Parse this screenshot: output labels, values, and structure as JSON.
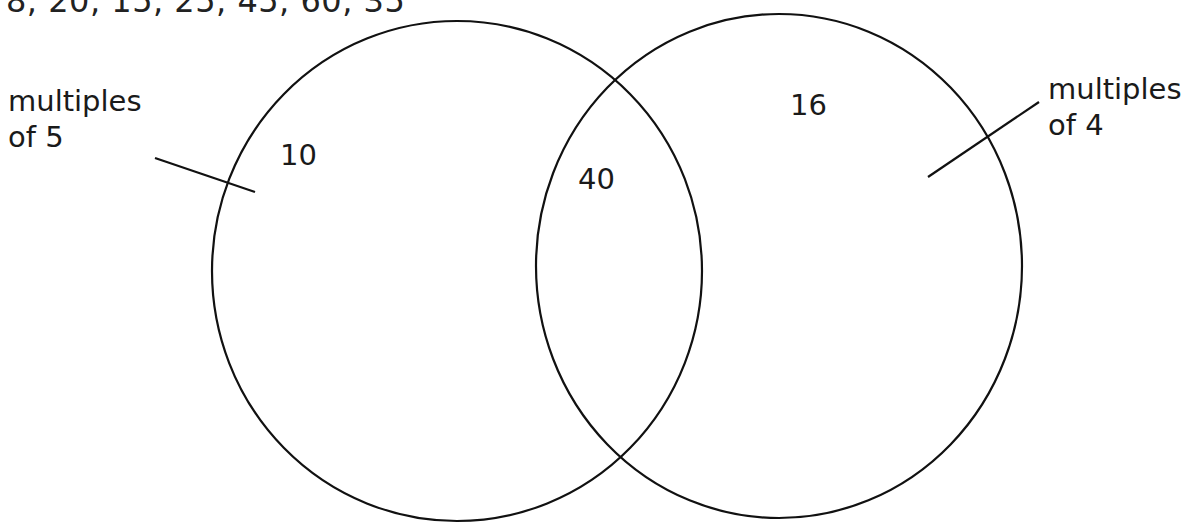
{
  "number_list": "8, 20, 15, 25, 45, 60, 35",
  "sets": {
    "left": {
      "label_line1": "multiples",
      "label_line2": "of 5"
    },
    "right": {
      "label_line1": "multiples",
      "label_line2": "of 4"
    }
  },
  "regions": {
    "left_only": "10",
    "intersection": "40",
    "right_only": "16"
  },
  "colors": {
    "stroke": "#111111",
    "background": "#ffffff"
  }
}
